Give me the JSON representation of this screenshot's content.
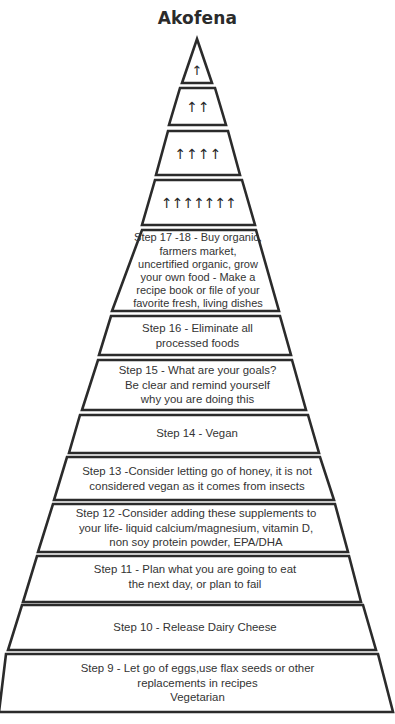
{
  "title": "Akofena",
  "colors": {
    "stroke": "#2b2b2b",
    "fill": "#ffffff",
    "text": "#333333"
  },
  "tiers": [
    {
      "id": "apex",
      "arrows": "↑",
      "arrow_count": 1,
      "icon": "up-arrow-icon"
    },
    {
      "id": "tier-2",
      "arrows": "↑↑",
      "arrow_count": 2,
      "icon": "up-arrow-icon"
    },
    {
      "id": "tier-3",
      "arrows": "↑↑↑↑",
      "arrow_count": 4,
      "icon": "up-arrow-icon"
    },
    {
      "id": "tier-4",
      "arrows": "↑↑↑↑↑↑↑",
      "arrow_count": 7,
      "icon": "up-arrow-icon"
    },
    {
      "id": "step-17-18",
      "text": "Step 17 -18 - Buy organic,\nfarmers market,\nuncertified  organic, grow\nyour own food - Make a\nrecipe book or file of your\nfavorite fresh, living dishes"
    },
    {
      "id": "step-16",
      "text": "Step 16 - Eliminate all\nprocessed foods"
    },
    {
      "id": "step-15",
      "text": "Step 15 - What are your goals?\nBe clear and remind yourself\nwhy you are doing this"
    },
    {
      "id": "step-14",
      "text": "Step 14 - Vegan"
    },
    {
      "id": "step-13",
      "text": "Step 13 -Consider letting go of honey, it is not\nconsidered vegan as it comes from insects"
    },
    {
      "id": "step-12",
      "text": "Step 12 -Consider adding these supplements to\nyour life- liquid calcium/magnesium, vitamin D,\nnon soy protein powder, EPA/DHA"
    },
    {
      "id": "step-11",
      "text": "Step 11 - Plan what you are going to eat\nthe next day, or plan to fail"
    },
    {
      "id": "step-10",
      "text": "Step 10 - Release Dairy Cheese"
    },
    {
      "id": "step-9",
      "text": "Step 9 - Let go of eggs,use flax seeds or other\nreplacements in recipes\nVegetarian"
    }
  ]
}
